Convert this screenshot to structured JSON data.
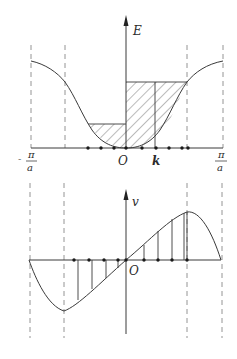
{
  "top_plot": {
    "y_axis_label": "E",
    "x_axis_label": "k",
    "origin_label": "O",
    "left_limit": {
      "numerator": "π",
      "denominator": "a",
      "sign": "-"
    },
    "right_limit": {
      "numerator": "π",
      "denominator": "a",
      "sign": ""
    }
  },
  "bottom_plot": {
    "y_axis_label": "v",
    "origin_label": "O"
  },
  "colors": {
    "line": "#3a3a3a",
    "dashed": "#7a7a7a",
    "hatch": "#555555",
    "background": "#ffffff"
  }
}
